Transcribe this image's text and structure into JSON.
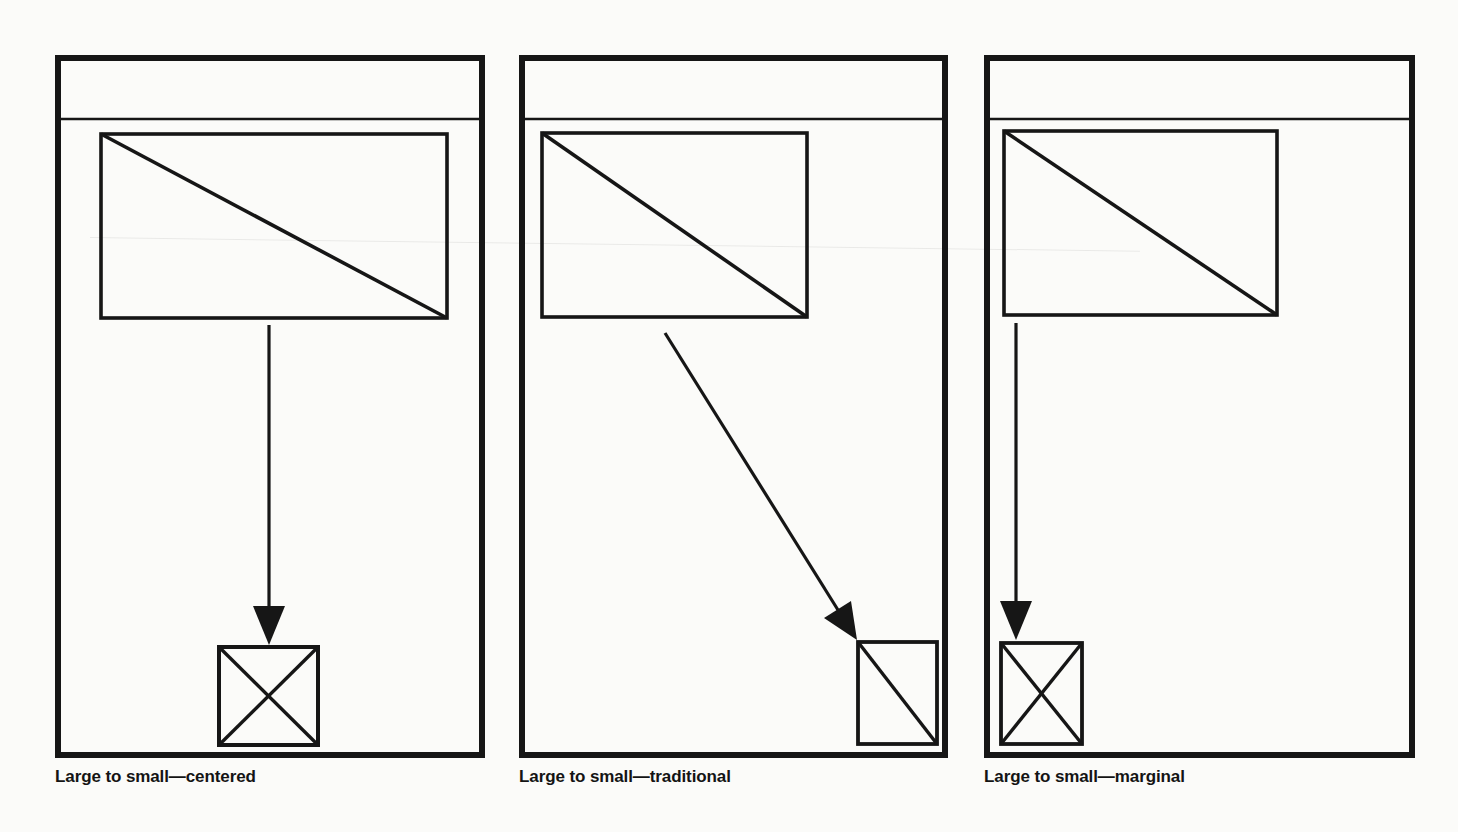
{
  "page": {
    "background_color": "#fbfbf9",
    "ink_color": "#161616"
  },
  "figure": {
    "panels": [
      {
        "caption": "Large to small—centered",
        "masthead": "empty-masthead-band",
        "large_image": "large-picture-placeholder-with-diagonal",
        "arrow": "vertical-down-arrow",
        "small_image": "small-picture-placeholder-with-x",
        "small_image_position": "bottom-center"
      },
      {
        "caption": "Large to small—traditional",
        "masthead": "empty-masthead-band",
        "large_image": "large-picture-placeholder-with-diagonal",
        "arrow": "diagonal-down-right-arrow",
        "small_image": "small-picture-placeholder-with-diagonal",
        "small_image_position": "bottom-right"
      },
      {
        "caption": "Large to small—marginal",
        "masthead": "empty-masthead-band",
        "large_image": "large-picture-placeholder-with-diagonal",
        "arrow": "vertical-down-arrow",
        "small_image": "small-picture-placeholder-with-x",
        "small_image_position": "bottom-left"
      }
    ]
  }
}
